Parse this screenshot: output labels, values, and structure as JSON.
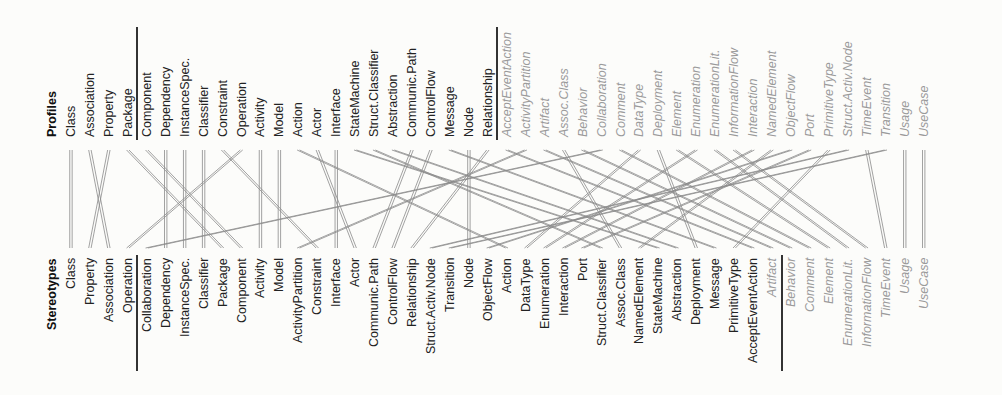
{
  "top": {
    "header": "Profiles",
    "items": [
      "Class",
      "Association",
      "Property",
      "Package",
      "Component",
      "Dependency",
      "InstanceSpec.",
      "Classifier",
      "Constraint",
      "Operation",
      "Activity",
      "Model",
      "Action",
      "Actor",
      "Interface",
      "StateMachine",
      "Struct.Classifier",
      "Abstraction",
      "Communic.Path",
      "ControlFlow",
      "Message",
      "Node",
      "Relationship",
      "AcceptEventAction",
      "ActivityPartition",
      "Artifact",
      "Assoc.Class",
      "Behavior",
      "Collaboration",
      "Comment",
      "DataType",
      "Deployment",
      "Element",
      "Enumeration",
      "EnumerationLit.",
      "InformationFlow",
      "Interaction",
      "NamedElement",
      "ObjectFlow",
      "Port",
      "PrimitiveType",
      "Struct.Activ.Node",
      "TimeEvent",
      "Transition",
      "Usage",
      "UseCase"
    ],
    "separators_after": [
      3,
      22
    ],
    "italic_from": 23
  },
  "bottom": {
    "header": "Stereotypes",
    "items": [
      "Class",
      "Property",
      "Association",
      "Operation",
      "Collaboration",
      "Dependency",
      "InstanceSpec.",
      "Classifier",
      "Package",
      "Component",
      "Activity",
      "Model",
      "ActivityPartition",
      "Constraint",
      "Interface",
      "Actor",
      "Communic.Path",
      "ControlFlow",
      "Relationship",
      "Struct.Activ.Node",
      "Transition",
      "Node",
      "ObjectFlow",
      "Action",
      "DataType",
      "Enumeration",
      "Interaction",
      "Port",
      "Struct.Classifier",
      "Assoc.Class",
      "NamedElement",
      "StateMachine",
      "Abstraction",
      "Deployment",
      "Message",
      "PrimitiveType",
      "AcceptEventAction",
      "Artifact",
      "Behavior",
      "Comment",
      "Element",
      "EnumerationLit.",
      "InformationFlow",
      "TimeEvent",
      "Usage",
      "UseCase"
    ],
    "separators_after": [
      3,
      37
    ],
    "italic_from": 37
  },
  "style": {
    "line_color": "#8a8a8a",
    "text_color": "#222222",
    "italic_color": "#9a9a9a"
  }
}
